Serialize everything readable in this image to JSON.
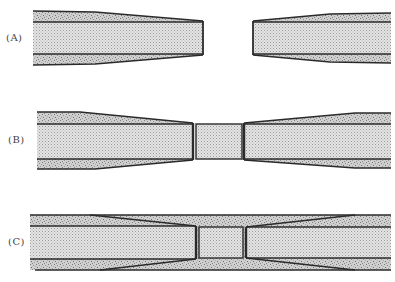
{
  "figure": {
    "panels": [
      {
        "id": "A",
        "label": "(A)",
        "description": "Two tapered fiber ends separated by a gap"
      },
      {
        "id": "B",
        "label": "(B)",
        "description": "Tapered fiber ends joined by a short central core segment"
      },
      {
        "id": "C",
        "label": "(C)",
        "description": "Fiber ends with central core segment enclosed in continuous cladding"
      }
    ]
  },
  "colors": {
    "outline": "#2a2a2a",
    "core_fill": "#d9d9d9",
    "cladding_fill": "#bdbdbd",
    "background": "#ffffff"
  }
}
